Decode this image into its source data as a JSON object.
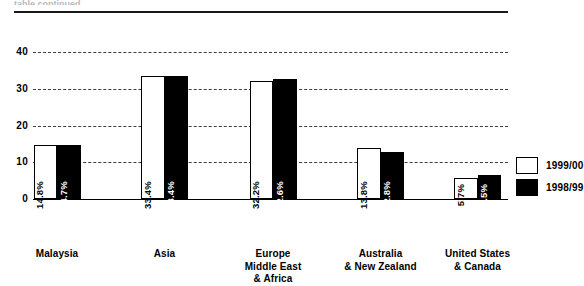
{
  "top_remnant": "table continued",
  "chart_data": {
    "type": "bar",
    "title": "",
    "subtitle": "",
    "xlabel": "",
    "ylabel": "",
    "ylim": [
      0,
      40
    ],
    "yticks": [
      0,
      10,
      20,
      30,
      40
    ],
    "ytick_labels": [
      "0",
      "10",
      "20",
      "30",
      "40"
    ],
    "grid": true,
    "grid_style": "dashed-horizontal",
    "legend_position": "right",
    "value_label_format": "percent",
    "value_label_orientation": "vertical",
    "categories": [
      "Malaysia",
      "Asia",
      "Europe\nMiddle East\n& Africa",
      "Australia\n& New Zealand",
      "United States\n& Canada"
    ],
    "category_lines": [
      [
        "Malaysia"
      ],
      [
        "Asia"
      ],
      [
        "Europe",
        "Middle East",
        "& Africa"
      ],
      [
        "Australia",
        "& New Zealand"
      ],
      [
        "United States",
        "& Canada"
      ]
    ],
    "series": [
      {
        "name": "1999/00",
        "color": "#ffffff",
        "values": [
          14.8,
          33.4,
          32.2,
          13.8,
          5.7
        ],
        "labels": [
          "14.8%",
          "33.4%",
          "32.2%",
          "13.8%",
          "5.7%"
        ]
      },
      {
        "name": "1998/99",
        "color": "#000000",
        "values": [
          14.7,
          33.4,
          32.6,
          12.8,
          6.5
        ],
        "labels": [
          "14.7%",
          "33.4%",
          "32.6%",
          "12.8%",
          "6.5%"
        ]
      }
    ]
  },
  "legend": {
    "items": [
      {
        "label": "1999/00",
        "style": "light"
      },
      {
        "label": "1998/99",
        "style": "dark"
      }
    ]
  }
}
